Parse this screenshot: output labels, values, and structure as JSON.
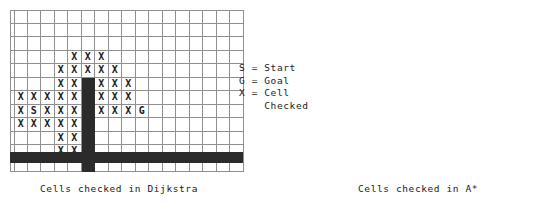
{
  "legend": {
    "lines": [
      "S = Start",
      "G = Goal",
      "X = Cell",
      "    Checked"
    ],
    "start_symbol": "S",
    "goal_symbol": "G",
    "checked_symbol": "X"
  },
  "colors": {
    "wall": "#2b2b2b",
    "gridline": "#8f8f8f",
    "text": "#1a1a1a",
    "background": "#ffffff"
  },
  "panels": [
    {
      "id": "dijkstra",
      "caption": "Cells checked in Dijkstra",
      "grid": {
        "cols": 17,
        "rows": 12,
        "cell_size": 13.5,
        "origin_x": 10,
        "origin_y": 10,
        "wall_col": 5,
        "wall_row_start": 5,
        "wall_row_end": 11,
        "bottom_wall_y": 152,
        "bottom_wall_height": 11,
        "bottom_wall_x": 10,
        "bottom_wall_width": 233,
        "start": [
          1,
          7
        ],
        "goal": [
          9,
          7
        ],
        "checked": [
          [
            0,
            0
          ],
          [
            1,
            0
          ],
          [
            2,
            0
          ],
          [
            3,
            0
          ],
          [
            4,
            0
          ],
          [
            5,
            0
          ],
          [
            6,
            0
          ],
          [
            7,
            0
          ],
          [
            8,
            0
          ],
          [
            9,
            0
          ],
          [
            0,
            1
          ],
          [
            1,
            1
          ],
          [
            2,
            1
          ],
          [
            3,
            1
          ],
          [
            4,
            1
          ],
          [
            5,
            1
          ],
          [
            6,
            1
          ],
          [
            7,
            1
          ],
          [
            8,
            1
          ],
          [
            9,
            1
          ],
          [
            0,
            2
          ],
          [
            1,
            2
          ],
          [
            2,
            2
          ],
          [
            3,
            2
          ],
          [
            4,
            2
          ],
          [
            5,
            2
          ],
          [
            6,
            2
          ],
          [
            7,
            2
          ],
          [
            8,
            2
          ],
          [
            9,
            2
          ],
          [
            0,
            3
          ],
          [
            1,
            3
          ],
          [
            2,
            3
          ],
          [
            3,
            3
          ],
          [
            4,
            3
          ],
          [
            5,
            3
          ],
          [
            6,
            3
          ],
          [
            7,
            3
          ],
          [
            8,
            3
          ],
          [
            9,
            3
          ],
          [
            10,
            3
          ],
          [
            0,
            4
          ],
          [
            1,
            4
          ],
          [
            2,
            4
          ],
          [
            3,
            4
          ],
          [
            4,
            4
          ],
          [
            5,
            4
          ],
          [
            6,
            4
          ],
          [
            7,
            4
          ],
          [
            8,
            4
          ],
          [
            9,
            4
          ],
          [
            10,
            4
          ],
          [
            0,
            5
          ],
          [
            1,
            5
          ],
          [
            2,
            5
          ],
          [
            3,
            5
          ],
          [
            4,
            5
          ],
          [
            6,
            5
          ],
          [
            7,
            5
          ],
          [
            8,
            5
          ],
          [
            9,
            5
          ],
          [
            10,
            5
          ],
          [
            0,
            6
          ],
          [
            1,
            6
          ],
          [
            2,
            6
          ],
          [
            3,
            6
          ],
          [
            4,
            6
          ],
          [
            6,
            6
          ],
          [
            7,
            6
          ],
          [
            8,
            6
          ],
          [
            9,
            6
          ],
          [
            0,
            7
          ],
          [
            1,
            7
          ],
          [
            2,
            7
          ],
          [
            3,
            7
          ],
          [
            4,
            7
          ],
          [
            6,
            7
          ],
          [
            7,
            7
          ],
          [
            8,
            7
          ],
          [
            0,
            8
          ],
          [
            1,
            8
          ],
          [
            2,
            8
          ],
          [
            3,
            8
          ],
          [
            4,
            8
          ],
          [
            6,
            8
          ],
          [
            7,
            8
          ],
          [
            8,
            8
          ],
          [
            0,
            9
          ],
          [
            1,
            9
          ],
          [
            2,
            9
          ],
          [
            3,
            9
          ],
          [
            4,
            9
          ],
          [
            0,
            10
          ],
          [
            1,
            10
          ],
          [
            2,
            10
          ],
          [
            3,
            10
          ],
          [
            4,
            10
          ],
          [
            0,
            11
          ],
          [
            1,
            11
          ],
          [
            2,
            11
          ],
          [
            3,
            11
          ],
          [
            4,
            11
          ]
        ]
      }
    },
    {
      "id": "astar",
      "caption": "Cells checked in A*",
      "grid": {
        "cols": 17,
        "rows": 12,
        "cell_size": 13.5,
        "origin_x": 14,
        "origin_y": 10,
        "wall_col": 5,
        "wall_row_start": 5,
        "wall_row_end": 11,
        "bottom_wall_y": 152,
        "bottom_wall_height": 11,
        "bottom_wall_x": 14,
        "bottom_wall_width": 229,
        "start": [
          1,
          7
        ],
        "goal": [
          9,
          7
        ],
        "checked": [
          [
            4,
            3
          ],
          [
            5,
            3
          ],
          [
            6,
            3
          ],
          [
            3,
            4
          ],
          [
            4,
            4
          ],
          [
            5,
            4
          ],
          [
            6,
            4
          ],
          [
            7,
            4
          ],
          [
            3,
            5
          ],
          [
            4,
            5
          ],
          [
            6,
            5
          ],
          [
            7,
            5
          ],
          [
            8,
            5
          ],
          [
            0,
            6
          ],
          [
            1,
            6
          ],
          [
            2,
            6
          ],
          [
            3,
            6
          ],
          [
            4,
            6
          ],
          [
            6,
            6
          ],
          [
            7,
            6
          ],
          [
            8,
            6
          ],
          [
            0,
            7
          ],
          [
            1,
            7
          ],
          [
            2,
            7
          ],
          [
            3,
            7
          ],
          [
            4,
            7
          ],
          [
            6,
            7
          ],
          [
            7,
            7
          ],
          [
            8,
            7
          ],
          [
            0,
            8
          ],
          [
            1,
            8
          ],
          [
            2,
            8
          ],
          [
            3,
            8
          ],
          [
            4,
            8
          ],
          [
            3,
            9
          ],
          [
            4,
            9
          ],
          [
            3,
            10
          ],
          [
            4,
            10
          ]
        ]
      }
    }
  ]
}
